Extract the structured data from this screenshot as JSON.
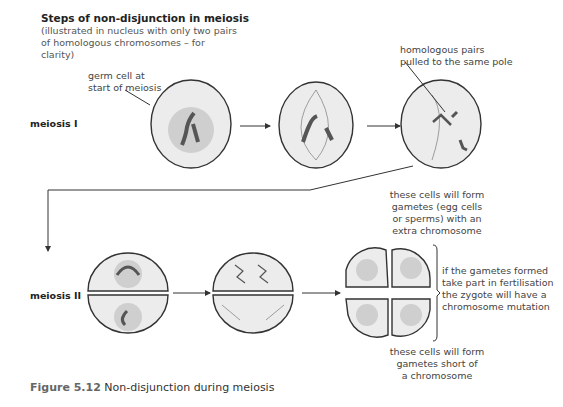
{
  "title": "Steps of non-disjunction in meiosis",
  "subtitle": [
    "(illustrated in nucleus with only two pairs",
    "of homologous chromosomes – for clarity)"
  ],
  "row_labels": {
    "meiosis1": "meiosis I",
    "meiosis2": "meiosis II"
  },
  "annotations": {
    "germ_cell": [
      "germ cell at",
      "start of meiosis"
    ],
    "homologous": [
      "homologous pairs",
      "pulled to the same pole"
    ],
    "extra": [
      "these cells will form",
      "gametes (egg cells",
      "or sperms) with an",
      "extra chromosome"
    ],
    "short": [
      "these cells will form",
      "gametes short of",
      "a chromosome"
    ],
    "fertilisation": [
      "if the gametes formed",
      "take part in fertilisation",
      "the zygote will have a",
      "chromosome mutation"
    ]
  },
  "caption": {
    "label": "Figure 5.12",
    "text": " Non-disjunction during meiosis"
  },
  "colors": {
    "cell_fill": "#ececec",
    "nucleus_fill": "#cfcfcf",
    "outline": "#333333",
    "chromosome": "#555555"
  }
}
